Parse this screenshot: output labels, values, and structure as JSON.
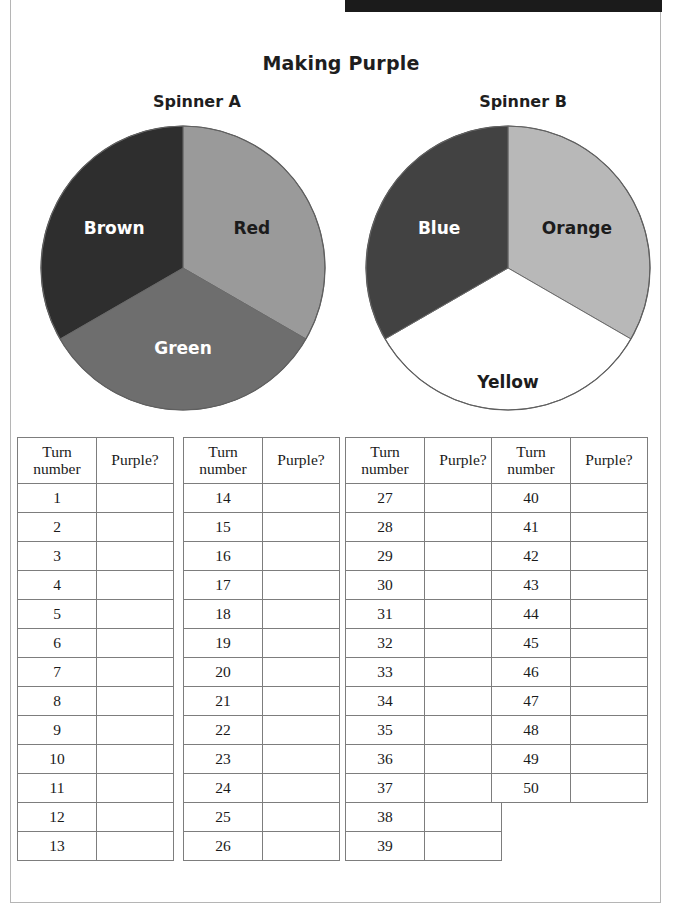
{
  "page": {
    "title": "Making Purple"
  },
  "top_bar": {
    "color": "#1b1b1b"
  },
  "spinners": [
    {
      "name": "spinner-a",
      "title": "Spinner A",
      "sectors": [
        {
          "label": "Red",
          "color": "#9a9a9a",
          "text_color": "#1c1c1c",
          "start_deg": 0,
          "end_deg": 120
        },
        {
          "label": "Green",
          "color": "#6e6e6e",
          "text_color": "#ffffff",
          "start_deg": 120,
          "end_deg": 240
        },
        {
          "label": "Brown",
          "color": "#2e2e2e",
          "text_color": "#ffffff",
          "start_deg": 240,
          "end_deg": 360
        }
      ]
    },
    {
      "name": "spinner-b",
      "title": "Spinner B",
      "sectors": [
        {
          "label": "Orange",
          "color": "#b8b8b8",
          "text_color": "#1c1c1c",
          "start_deg": 0,
          "end_deg": 120
        },
        {
          "label": "Yellow",
          "color": "#ffffff",
          "text_color": "#1c1c1c",
          "start_deg": 120,
          "end_deg": 240
        },
        {
          "label": "Blue",
          "color": "#424242",
          "text_color": "#ffffff",
          "start_deg": 240,
          "end_deg": 360
        }
      ]
    }
  ],
  "tables": {
    "headers": {
      "turn_number_line1": "Turn",
      "turn_number_line2": "number",
      "purple": "Purple?"
    },
    "columns": [
      {
        "name": "table-1",
        "rows": [
          "1",
          "2",
          "3",
          "4",
          "5",
          "6",
          "7",
          "8",
          "9",
          "10",
          "11",
          "12",
          "13"
        ]
      },
      {
        "name": "table-2",
        "rows": [
          "14",
          "15",
          "16",
          "17",
          "18",
          "19",
          "20",
          "21",
          "22",
          "23",
          "24",
          "25",
          "26"
        ]
      },
      {
        "name": "table-3",
        "rows": [
          "27",
          "28",
          "29",
          "30",
          "31",
          "32",
          "33",
          "34",
          "35",
          "36",
          "37",
          "38",
          "39"
        ]
      },
      {
        "name": "table-4",
        "rows": [
          "40",
          "41",
          "42",
          "43",
          "44",
          "45",
          "46",
          "47",
          "48",
          "49",
          "50"
        ]
      }
    ]
  }
}
